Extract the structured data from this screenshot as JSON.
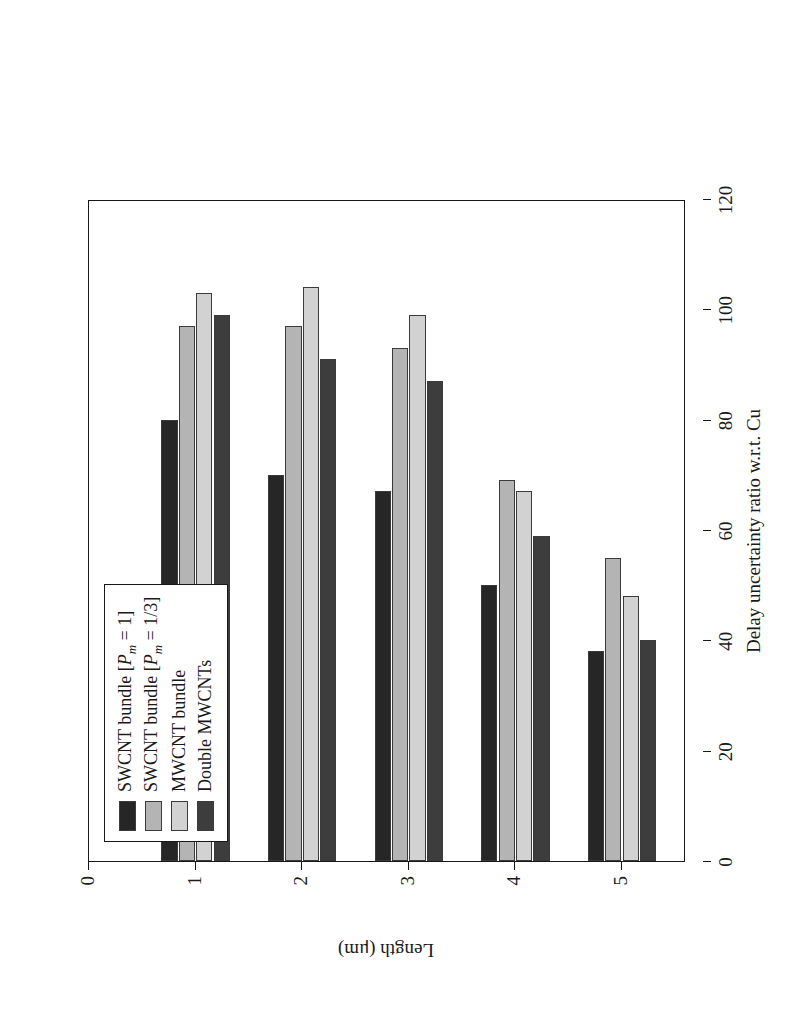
{
  "figure": {
    "background": "#ffffff",
    "rotation_degrees": -90,
    "note_rendered_rotated": true
  },
  "legend": {
    "position": "top-left",
    "items": [
      {
        "label": "SWCNT bundle [Pm = 1]",
        "color": "#262626"
      },
      {
        "label": "SWCNT bundle [Pm = 1/3]",
        "color": "#b4b4b4"
      },
      {
        "label": "MWCNT bundle",
        "color": "#d2d2d2"
      },
      {
        "label": "Double MWCNTs",
        "color": "#3d3d3d"
      }
    ]
  },
  "chart_data": {
    "type": "bar",
    "orientation": "vertical",
    "title": "",
    "xlabel": "Length (μm)",
    "ylabel": "Delay uncertainty ratio w.r.t. Cu",
    "categories": [
      "1",
      "2",
      "3",
      "4",
      "5"
    ],
    "x": [
      1,
      2,
      3,
      4,
      5
    ],
    "xlim": [
      0,
      5.6
    ],
    "xticks": [
      0,
      1,
      2,
      3,
      4,
      5
    ],
    "ylim": [
      0,
      120
    ],
    "yticks": [
      0,
      20,
      40,
      60,
      80,
      100,
      120
    ],
    "grid": false,
    "legend_position": "upper left",
    "series": [
      {
        "name": "SWCNT bundle [Pm = 1]",
        "color": "#262626",
        "values": [
          80,
          70,
          67,
          50,
          38
        ]
      },
      {
        "name": "SWCNT bundle [Pm = 1/3]",
        "color": "#b4b4b4",
        "values": [
          97,
          97,
          93,
          69,
          55
        ]
      },
      {
        "name": "MWCNT bundle",
        "color": "#d2d2d2",
        "values": [
          103,
          104,
          99,
          67,
          48
        ]
      },
      {
        "name": "Double MWCNTs",
        "color": "#3d3d3d",
        "values": [
          99,
          91,
          87,
          59,
          40
        ]
      }
    ]
  }
}
